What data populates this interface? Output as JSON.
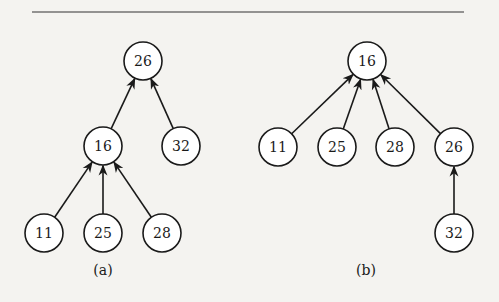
{
  "figures": [
    {
      "id": "a",
      "caption": "(a)",
      "nodes": [
        {
          "id": "a26",
          "label": "26"
        },
        {
          "id": "a16",
          "label": "16"
        },
        {
          "id": "a32",
          "label": "32"
        },
        {
          "id": "a11",
          "label": "11"
        },
        {
          "id": "a25",
          "label": "25"
        },
        {
          "id": "a28",
          "label": "28"
        }
      ],
      "edges": [
        {
          "from": "a16",
          "to": "a26"
        },
        {
          "from": "a32",
          "to": "a26"
        },
        {
          "from": "a11",
          "to": "a16"
        },
        {
          "from": "a25",
          "to": "a16"
        },
        {
          "from": "a28",
          "to": "a16"
        }
      ]
    },
    {
      "id": "b",
      "caption": "(b)",
      "nodes": [
        {
          "id": "b16",
          "label": "16"
        },
        {
          "id": "b11",
          "label": "11"
        },
        {
          "id": "b25",
          "label": "25"
        },
        {
          "id": "b28",
          "label": "28"
        },
        {
          "id": "b26",
          "label": "26"
        },
        {
          "id": "b32",
          "label": "32"
        }
      ],
      "edges": [
        {
          "from": "b11",
          "to": "b16"
        },
        {
          "from": "b25",
          "to": "b16"
        },
        {
          "from": "b28",
          "to": "b16"
        },
        {
          "from": "b26",
          "to": "b16"
        },
        {
          "from": "b32",
          "to": "b26"
        }
      ]
    }
  ]
}
